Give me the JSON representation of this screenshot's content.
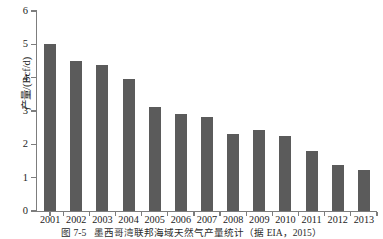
{
  "chart_data": {
    "type": "bar",
    "title": "",
    "xlabel": "",
    "ylabel": "产量/(Bcf/d)",
    "ylim": [
      0,
      6
    ],
    "ytick_labels": [
      "0",
      "1",
      "2",
      "3",
      "4",
      "5",
      "6"
    ],
    "yticks": [
      0,
      1,
      2,
      3,
      4,
      5,
      6
    ],
    "grid": false,
    "legend": null,
    "bar_color": "#5b5b5b",
    "axis_color": "#7d7d7d",
    "categories": [
      "2001",
      "2002",
      "2003",
      "2004",
      "2005",
      "2006",
      "2007",
      "2008",
      "2009",
      "2010",
      "2011",
      "2012",
      "2013"
    ],
    "values": [
      5.02,
      4.5,
      4.38,
      3.97,
      3.12,
      2.91,
      2.81,
      2.31,
      2.43,
      2.25,
      1.8,
      1.38,
      1.23
    ]
  },
  "caption": {
    "number": "图 7-5",
    "text": "墨西哥湾联邦海域天然气产量统计（据 EIA，2015）"
  }
}
